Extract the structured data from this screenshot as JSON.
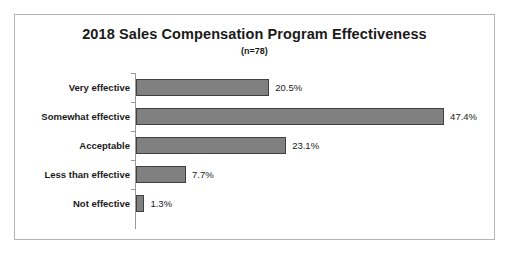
{
  "chart_data": {
    "type": "bar",
    "orientation": "horizontal",
    "title": "2018 Sales Compensation Program Effectiveness",
    "subtitle": "(n=78)",
    "xlabel": "",
    "ylabel": "",
    "categories": [
      "Very effective",
      "Somewhat effective",
      "Acceptable",
      "Less than effective",
      "Not effective"
    ],
    "values": [
      20.5,
      47.4,
      23.1,
      7.7,
      1.3
    ],
    "value_labels": [
      "20.5%",
      "47.4%",
      "23.1%",
      "7.7%",
      "1.3%"
    ],
    "xlim": [
      0,
      55
    ],
    "grid": false,
    "legend": null,
    "bar_color": "#808080",
    "bar_border_color": "#404040",
    "axis_color": "#9a9a9a",
    "frame_color": "#b4b4b4",
    "text_color": "#1a1a1a"
  }
}
